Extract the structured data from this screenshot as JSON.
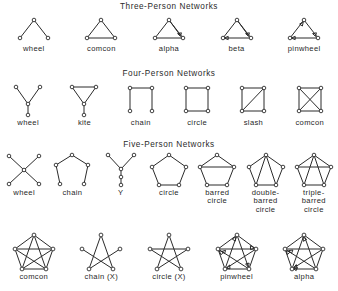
{
  "figure": {
    "background": "#ffffff",
    "ink": "#2b2b2b",
    "sections": [
      {
        "id": "three-person",
        "title": "Three-Person Networks",
        "items": [
          {
            "name": "wheel",
            "label": "wheel"
          },
          {
            "name": "comcon",
            "label": "comcon"
          },
          {
            "name": "alpha",
            "label": "alpha"
          },
          {
            "name": "beta",
            "label": "beta"
          },
          {
            "name": "pinwheel",
            "label": "pinwheel"
          }
        ]
      },
      {
        "id": "four-person",
        "title": "Four-Person Networks",
        "items": [
          {
            "name": "wheel",
            "label": "wheel"
          },
          {
            "name": "kite",
            "label": "kite"
          },
          {
            "name": "chain",
            "label": "chain"
          },
          {
            "name": "circle",
            "label": "circle"
          },
          {
            "name": "slash",
            "label": "slash"
          },
          {
            "name": "comcon",
            "label": "comcon"
          }
        ]
      },
      {
        "id": "five-person",
        "title": "Five-Person Networks",
        "items": [
          {
            "name": "wheel",
            "label": "wheel"
          },
          {
            "name": "chain",
            "label": "chain"
          },
          {
            "name": "y",
            "label": "Y"
          },
          {
            "name": "circle",
            "label": "circle"
          },
          {
            "name": "barred-circle",
            "label": "barred\ncircle"
          },
          {
            "name": "double-barred-circle",
            "label": "double-\nbarred\ncircle"
          },
          {
            "name": "triple-barred-circle",
            "label": "triple-\nbarred\ncircle"
          }
        ]
      },
      {
        "id": "five-person-second",
        "title": "",
        "items": [
          {
            "name": "comcon",
            "label": "comcon"
          },
          {
            "name": "chain-x",
            "label": "chain  (X)"
          },
          {
            "name": "circle-x",
            "label": "circle (X)"
          },
          {
            "name": "pinwheel",
            "label": "pinwheel"
          },
          {
            "name": "alpha",
            "label": "alpha"
          }
        ]
      }
    ]
  }
}
